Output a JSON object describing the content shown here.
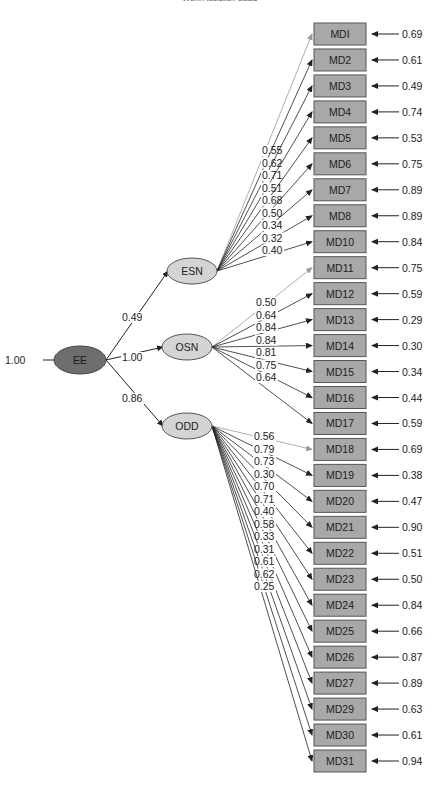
{
  "header": {
    "running_title": "Work Addiction Scale"
  },
  "diagram": {
    "type": "structural-equation-model",
    "root": {
      "id": "EE",
      "label": "EE",
      "variance": "1.00",
      "fill": "#6e6e6e"
    },
    "factors": [
      {
        "id": "ESN",
        "label": "ESN",
        "path_from_root": "0.49",
        "fill": "#d4d4d4",
        "items": [
          "MDI",
          "MD2",
          "MD3",
          "MD4",
          "MD5",
          "MD6",
          "MD7",
          "MD8",
          "MD10"
        ],
        "loadings": [
          "0.55",
          "0.62",
          "0.71",
          "0.51",
          "0.68",
          "0.50",
          "0.34",
          "0.32",
          "0.40"
        ]
      },
      {
        "id": "OSN",
        "label": "OSN",
        "path_from_root": "1.00",
        "fill": "#d4d4d4",
        "items": [
          "MD11",
          "MD12",
          "MD13",
          "MD14",
          "MD15",
          "MD16",
          "MD17"
        ],
        "loadings": [
          "0.50",
          "0.64",
          "0.84",
          "0.84",
          "0.81",
          "0.75",
          "0.64"
        ]
      },
      {
        "id": "ODD",
        "label": "ODD",
        "path_from_root": "0.86",
        "fill": "#d4d4d4",
        "items": [
          "MD18",
          "MD19",
          "MD20",
          "MD21",
          "MD22",
          "MD23",
          "MD24",
          "MD25",
          "MD26",
          "MD27",
          "MD29",
          "MD30",
          "MD31"
        ],
        "loadings": [
          "0.56",
          "0.79",
          "0.73",
          "0.30",
          "0.70",
          "0.71",
          "0.40",
          "0.58",
          "0.33",
          "0.31",
          "0.61",
          "0.62",
          "0.25"
        ]
      }
    ],
    "indicators": [
      {
        "label": "MDI",
        "error": "0.69"
      },
      {
        "label": "MD2",
        "error": "0.61"
      },
      {
        "label": "MD3",
        "error": "0.49"
      },
      {
        "label": "MD4",
        "error": "0.74"
      },
      {
        "label": "MD5",
        "error": "0.53"
      },
      {
        "label": "MD6",
        "error": "0.75"
      },
      {
        "label": "MD7",
        "error": "0.89"
      },
      {
        "label": "MD8",
        "error": "0.89"
      },
      {
        "label": "MD10",
        "error": "0.84"
      },
      {
        "label": "MD11",
        "error": "0.75"
      },
      {
        "label": "MD12",
        "error": "0.59"
      },
      {
        "label": "MD13",
        "error": "0.29"
      },
      {
        "label": "MD14",
        "error": "0.30"
      },
      {
        "label": "MD15",
        "error": "0.34"
      },
      {
        "label": "MD16",
        "error": "0.44"
      },
      {
        "label": "MD17",
        "error": "0.59"
      },
      {
        "label": "MD18",
        "error": "0.69"
      },
      {
        "label": "MD19",
        "error": "0.38"
      },
      {
        "label": "MD20",
        "error": "0.47"
      },
      {
        "label": "MD21",
        "error": "0.90"
      },
      {
        "label": "MD22",
        "error": "0.51"
      },
      {
        "label": "MD23",
        "error": "0.50"
      },
      {
        "label": "MD24",
        "error": "0.84"
      },
      {
        "label": "MD25",
        "error": "0.66"
      },
      {
        "label": "MD26",
        "error": "0.87"
      },
      {
        "label": "MD27",
        "error": "0.89"
      },
      {
        "label": "MD29",
        "error": "0.63"
      },
      {
        "label": "MD30",
        "error": "0.61"
      },
      {
        "label": "MD31",
        "error": "0.94"
      }
    ],
    "colors": {
      "box_fill": "#a8a8a8",
      "box_stroke": "#555555",
      "factor_fill": "#d4d4d4",
      "root_fill": "#6e6e6e",
      "line": "#222222",
      "fixed_line": "#999999",
      "text": "#222222"
    }
  }
}
